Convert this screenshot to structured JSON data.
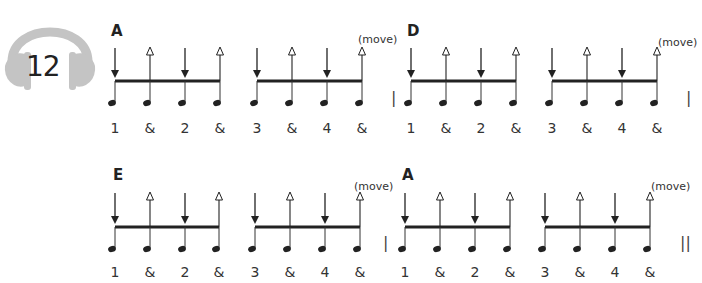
{
  "track": {
    "number": "12",
    "icon": "headphones-icon",
    "color": "#bdbdbd"
  },
  "rows": [
    {
      "measures": [
        {
          "chord": "A",
          "move_label": "(move)",
          "counts": [
            "1",
            "&",
            "2",
            "&",
            "3",
            "&",
            "4",
            "&"
          ],
          "bar_line": "|"
        },
        {
          "chord": "D",
          "move_label": "(move)",
          "counts": [
            "1",
            "&",
            "2",
            "&",
            "3",
            "&",
            "4",
            "&"
          ],
          "bar_line": "|"
        }
      ]
    },
    {
      "measures": [
        {
          "chord": "E",
          "move_label": "(move)",
          "counts": [
            "1",
            "&",
            "2",
            "&",
            "3",
            "&",
            "4",
            "&"
          ],
          "bar_line": "|"
        },
        {
          "chord": "A",
          "move_label": "(move)",
          "counts": [
            "1",
            "&",
            "2",
            "&",
            "3",
            "&",
            "4",
            "&"
          ],
          "bar_line": "||"
        }
      ]
    }
  ],
  "strum_pattern": [
    "down",
    "up",
    "down",
    "up",
    "down",
    "up",
    "down",
    "up"
  ]
}
